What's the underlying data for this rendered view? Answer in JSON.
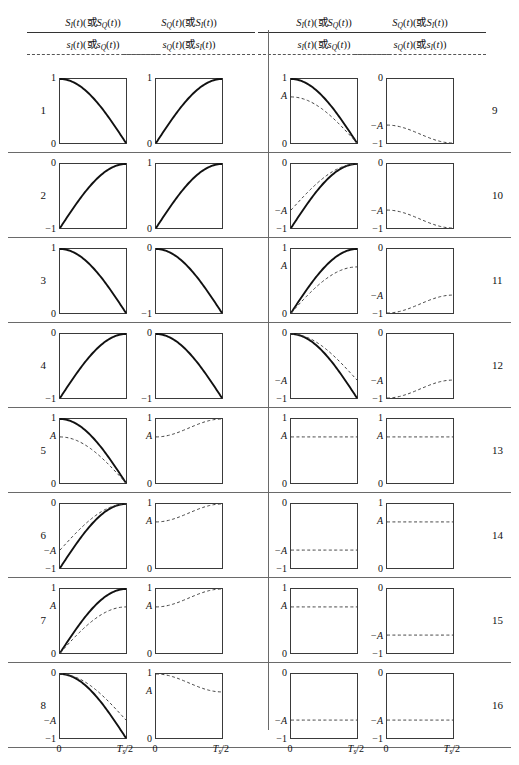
{
  "figure": {
    "width": 519,
    "height": 765,
    "headers": [
      {
        "upper": "S_I(t)(或S_Q(t))",
        "lower": "s_I(t)(或s_Q(t))"
      },
      {
        "upper": "S_Q(t)(或S_I(t))",
        "lower": "s_Q(t)(或s_I(t))"
      },
      {
        "upper": "S_I(t)(或S_Q(t))",
        "lower": "s_I(t)(或s_Q(t))"
      },
      {
        "upper": "S_Q(t)(或S_I(t))",
        "lower": "s_Q(t)(或s_I(t))"
      }
    ],
    "header_parts": {
      "S": "S",
      "s": "s",
      "I": "I",
      "Q": "Q",
      "paren_open": "(",
      "paren_close": ")",
      "t": "t",
      "or": "或"
    },
    "xticks": {
      "left": "0",
      "right": "T",
      "right_sub": "s",
      "right_tail": "/2"
    },
    "row_numbers": [
      "1",
      "2",
      "3",
      "4",
      "5",
      "6",
      "7",
      "8",
      "9",
      "10",
      "11",
      "12",
      "13",
      "14",
      "15",
      "16"
    ],
    "labels": {
      "one": "1",
      "zero": "0",
      "neg_one": "−1",
      "A": "A",
      "negA": "−A"
    },
    "colors": {
      "solid": "#111111",
      "dashed": "#444444",
      "frame": "#3a3a3a",
      "rule": "#6a6a6a"
    }
  },
  "chart_data": {
    "type": "line",
    "title": "",
    "xlabel": "",
    "ylabel": "",
    "x": [
      0,
      1
    ],
    "xtick_labels": [
      "0",
      "Ts/2"
    ],
    "grid": false,
    "legend": "none",
    "note": "16 rows x 2 waveform panels. Each panel plots normalized time 0..Ts/2. Solid curve = S(t) baseband shaping; dashed curve = s(t) amplitude-scaled version with peak A.",
    "panels": [
      {
        "row": "1",
        "left": {
          "ylim": [
            0,
            1
          ],
          "ytop": "1",
          "ybot": "0",
          "curves": [
            {
              "style": "solid",
              "shape": "cos_quarter_down",
              "from": 1,
              "to": 0
            }
          ]
        },
        "right": {
          "ylim": [
            0,
            1
          ],
          "ytop": "1",
          "ybot": "0",
          "curves": [
            {
              "style": "solid",
              "shape": "sin_quarter_up",
              "from": 0,
              "to": 1
            }
          ]
        }
      },
      {
        "row": "2",
        "left": {
          "ylim": [
            -1,
            0
          ],
          "ytop": "0",
          "ybot": "−1",
          "curves": [
            {
              "style": "solid",
              "shape": "sin_quarter_up",
              "from": -1,
              "to": 0
            }
          ]
        },
        "right": {
          "ylim": [
            0,
            1
          ],
          "ytop": "1",
          "ybot": "0",
          "curves": [
            {
              "style": "solid",
              "shape": "sin_quarter_up",
              "from": 0,
              "to": 1
            }
          ]
        }
      },
      {
        "row": "3",
        "left": {
          "ylim": [
            0,
            1
          ],
          "ytop": "1",
          "ybot": "0",
          "curves": [
            {
              "style": "solid",
              "shape": "cos_quarter_down",
              "from": 1,
              "to": 0
            }
          ]
        },
        "right": {
          "ylim": [
            -1,
            0
          ],
          "ytop": "0",
          "ybot": "−1",
          "curves": [
            {
              "style": "solid",
              "shape": "cos_quarter_down",
              "from": 0,
              "to": -1
            }
          ]
        }
      },
      {
        "row": "4",
        "left": {
          "ylim": [
            -1,
            0
          ],
          "ytop": "0",
          "ybot": "−1",
          "curves": [
            {
              "style": "solid",
              "shape": "sin_quarter_up",
              "from": -1,
              "to": 0
            }
          ]
        },
        "right": {
          "ylim": [
            -1,
            0
          ],
          "ytop": "0",
          "ybot": "−1",
          "curves": [
            {
              "style": "solid",
              "shape": "cos_quarter_down",
              "from": 0,
              "to": -1
            }
          ]
        }
      },
      {
        "row": "5",
        "left": {
          "ylim": [
            0,
            1
          ],
          "ytop": "1",
          "ymid": "A",
          "ybot": "0",
          "curves": [
            {
              "style": "solid",
              "shape": "cos_quarter_down",
              "from": 1,
              "to": 0
            },
            {
              "style": "dashed",
              "shape": "cos_quarter_down",
              "from": 0.72,
              "to": 0
            }
          ]
        },
        "right": {
          "ylim": [
            0,
            1
          ],
          "ytop": "1",
          "ymid": "A",
          "ybot": "0",
          "curves": [
            {
              "style": "dashed",
              "shape": "rise_A_to_1",
              "from": 0.72,
              "to": 1
            }
          ]
        }
      },
      {
        "row": "6",
        "left": {
          "ylim": [
            -1,
            0
          ],
          "ytop": "0",
          "ymid": "−A",
          "ybot": "−1",
          "curves": [
            {
              "style": "solid",
              "shape": "sin_quarter_up",
              "from": -1,
              "to": 0
            },
            {
              "style": "dashed",
              "shape": "rise_negA_to_0",
              "from": -0.72,
              "to": 0
            }
          ]
        },
        "right": {
          "ylim": [
            0,
            1
          ],
          "ytop": "1",
          "ymid": "A",
          "ybot": "0",
          "curves": [
            {
              "style": "dashed",
              "shape": "rise_A_to_1",
              "from": 0.72,
              "to": 1
            }
          ]
        }
      },
      {
        "row": "7",
        "left": {
          "ylim": [
            0,
            1
          ],
          "ytop": "1",
          "ymid": "A",
          "ybot": "0",
          "curves": [
            {
              "style": "solid",
              "shape": "sin_quarter_up",
              "from": 0,
              "to": 1
            },
            {
              "style": "dashed",
              "shape": "sin_quarter_up",
              "from": 0,
              "to": 0.72
            }
          ]
        },
        "right": {
          "ylim": [
            0,
            1
          ],
          "ytop": "1",
          "ymid": "A",
          "ybot": "0",
          "curves": [
            {
              "style": "dashed",
              "shape": "rise_A_to_1",
              "from": 0.72,
              "to": 1
            }
          ]
        }
      },
      {
        "row": "8",
        "left": {
          "ylim": [
            -1,
            0
          ],
          "ytop": "0",
          "ymid": "−A",
          "ybot": "−1",
          "curves": [
            {
              "style": "solid",
              "shape": "cos_quarter_down",
              "from": 0,
              "to": -1
            },
            {
              "style": "dashed",
              "shape": "cos_quarter_down",
              "from": 0,
              "to": -0.72
            }
          ]
        },
        "right": {
          "ylim": [
            0,
            1
          ],
          "ytop": "1",
          "ymid": "A",
          "ybot": "0",
          "curves": [
            {
              "style": "dashed",
              "shape": "fall_1_to_A",
              "from": 1,
              "to": 0.72
            }
          ]
        }
      },
      {
        "row": "9",
        "left": {
          "ylim": [
            0,
            1
          ],
          "ytop": "1",
          "ymid": "A",
          "ybot": "0",
          "curves": [
            {
              "style": "solid",
              "shape": "cos_quarter_down",
              "from": 1,
              "to": 0
            },
            {
              "style": "dashed",
              "shape": "cos_quarter_down",
              "from": 0.72,
              "to": 0
            }
          ]
        },
        "right": {
          "ylim": [
            -1,
            0
          ],
          "ytop": "0",
          "ymid": "−A",
          "ybot": "−1",
          "curves": [
            {
              "style": "dashed",
              "shape": "fall_negA_to_neg1",
              "from": -0.72,
              "to": -1
            }
          ]
        }
      },
      {
        "row": "10",
        "left": {
          "ylim": [
            -1,
            0
          ],
          "ytop": "0",
          "ymid": "−A",
          "ybot": "−1",
          "curves": [
            {
              "style": "solid",
              "shape": "sin_quarter_up",
              "from": -1,
              "to": 0
            },
            {
              "style": "dashed",
              "shape": "rise_negA_to_0",
              "from": -0.72,
              "to": 0
            }
          ]
        },
        "right": {
          "ylim": [
            -1,
            0
          ],
          "ytop": "0",
          "ymid": "−A",
          "ybot": "−1",
          "curves": [
            {
              "style": "dashed",
              "shape": "fall_negA_to_neg1",
              "from": -0.72,
              "to": -1
            }
          ]
        }
      },
      {
        "row": "11",
        "left": {
          "ylim": [
            0,
            1
          ],
          "ytop": "1",
          "ymid": "A",
          "ybot": "0",
          "curves": [
            {
              "style": "solid",
              "shape": "sin_quarter_up",
              "from": 0,
              "to": 1
            },
            {
              "style": "dashed",
              "shape": "sin_quarter_up",
              "from": 0,
              "to": 0.72
            }
          ]
        },
        "right": {
          "ylim": [
            -1,
            0
          ],
          "ytop": "0",
          "ymid": "−A",
          "ybot": "−1",
          "curves": [
            {
              "style": "dashed",
              "shape": "rise_neg1_to_negA",
              "from": -1,
              "to": -0.72
            }
          ]
        }
      },
      {
        "row": "12",
        "left": {
          "ylim": [
            -1,
            0
          ],
          "ytop": "0",
          "ymid": "−A",
          "ybot": "−1",
          "curves": [
            {
              "style": "solid",
              "shape": "cos_quarter_down",
              "from": 0,
              "to": -1
            },
            {
              "style": "dashed",
              "shape": "cos_quarter_down",
              "from": 0,
              "to": -0.72
            }
          ]
        },
        "right": {
          "ylim": [
            -1,
            0
          ],
          "ytop": "0",
          "ymid": "−A",
          "ybot": "−1",
          "curves": [
            {
              "style": "dashed",
              "shape": "rise_neg1_to_negA",
              "from": -1,
              "to": -0.72
            }
          ]
        }
      },
      {
        "row": "13",
        "left": {
          "ylim": [
            0,
            1
          ],
          "ytop": "1",
          "ymid": "A",
          "ybot": "0",
          "curves": [
            {
              "style": "dashed",
              "shape": "flat",
              "from": 0.72,
              "to": 0.72
            }
          ]
        },
        "right": {
          "ylim": [
            0,
            1
          ],
          "ytop": "1",
          "ymid": "A",
          "ybot": "0",
          "curves": [
            {
              "style": "dashed",
              "shape": "flat",
              "from": 0.72,
              "to": 0.72
            }
          ]
        }
      },
      {
        "row": "14",
        "left": {
          "ylim": [
            -1,
            0
          ],
          "ytop": "0",
          "ymid": "−A",
          "ybot": "−1",
          "curves": [
            {
              "style": "dashed",
              "shape": "flat",
              "from": -0.72,
              "to": -0.72
            }
          ]
        },
        "right": {
          "ylim": [
            0,
            1
          ],
          "ytop": "1",
          "ymid": "A",
          "ybot": "0",
          "curves": [
            {
              "style": "dashed",
              "shape": "flat",
              "from": 0.72,
              "to": 0.72
            }
          ]
        }
      },
      {
        "row": "15",
        "left": {
          "ylim": [
            0,
            1
          ],
          "ytop": "1",
          "ymid": "A",
          "ybot": "0",
          "curves": [
            {
              "style": "dashed",
              "shape": "flat",
              "from": 0.72,
              "to": 0.72
            }
          ]
        },
        "right": {
          "ylim": [
            -1,
            0
          ],
          "ytop": "0",
          "ymid": "−A",
          "ybot": "−1",
          "curves": [
            {
              "style": "dashed",
              "shape": "flat",
              "from": -0.72,
              "to": -0.72
            }
          ]
        }
      },
      {
        "row": "16",
        "left": {
          "ylim": [
            -1,
            0
          ],
          "ytop": "0",
          "ymid": "−A",
          "ybot": "−1",
          "curves": [
            {
              "style": "dashed",
              "shape": "flat",
              "from": -0.72,
              "to": -0.72
            }
          ]
        },
        "right": {
          "ylim": [
            -1,
            0
          ],
          "ytop": "0",
          "ymid": "−A",
          "ybot": "−1",
          "curves": [
            {
              "style": "dashed",
              "shape": "flat",
              "from": -0.72,
              "to": -0.72
            }
          ]
        }
      }
    ]
  }
}
